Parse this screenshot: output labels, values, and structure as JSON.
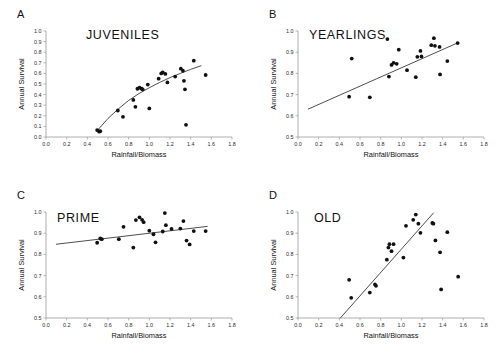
{
  "figure": {
    "background": "#ffffff",
    "point_color": "#101010",
    "line_color": "#3a3a3a",
    "axis_color": "#9a9a9a"
  },
  "axes": {
    "xlabel": "Rainfall/Biomass",
    "ylabel": "Annual Survival",
    "xlim": [
      0.0,
      1.8
    ],
    "xticks": [
      "0.0",
      "0.2",
      "0.4",
      "0.6",
      "0.8",
      "1.0",
      "1.2",
      "1.4",
      "1.6",
      "1.8"
    ],
    "yticks_full": [
      "0.0",
      "0.1",
      "0.2",
      "0.3",
      "0.4",
      "0.5",
      "0.6",
      "0.7",
      "0.8",
      "0.9",
      "1.0"
    ],
    "yticks_half": [
      "0.5",
      "0.6",
      "0.7",
      "0.8",
      "0.9",
      "1.0"
    ]
  },
  "panels": [
    {
      "letter": "A",
      "title": "JUVENILES"
    },
    {
      "letter": "B",
      "title": "YEARLINGS"
    },
    {
      "letter": "C",
      "title": "PRIME"
    },
    {
      "letter": "D",
      "title": "OLD"
    }
  ],
  "chart_data": [
    {
      "type": "scatter",
      "panel": "A",
      "title": "JUVENILES",
      "xlabel": "Rainfall/Biomass",
      "ylabel": "Annual Survival",
      "xlim": [
        0.0,
        1.8
      ],
      "ylim": [
        0.0,
        1.0
      ],
      "grid": false,
      "legend": "none",
      "fit": {
        "kind": "curve",
        "note": "saturating (log-like) fitted curve",
        "points": [
          [
            0.5,
            0.065
          ],
          [
            0.6,
            0.175
          ],
          [
            0.7,
            0.265
          ],
          [
            0.8,
            0.345
          ],
          [
            0.9,
            0.41
          ],
          [
            1.0,
            0.465
          ],
          [
            1.1,
            0.515
          ],
          [
            1.2,
            0.56
          ],
          [
            1.3,
            0.6
          ],
          [
            1.4,
            0.638
          ],
          [
            1.5,
            0.672
          ]
        ]
      },
      "x": [
        0.495,
        0.515,
        0.525,
        0.695,
        0.745,
        0.845,
        0.865,
        0.885,
        0.905,
        0.925,
        0.935,
        0.985,
        1.0,
        1.09,
        1.115,
        1.13,
        1.155,
        1.175,
        1.25,
        1.305,
        1.325,
        1.335,
        1.345,
        1.355,
        1.43,
        1.545
      ],
      "y": [
        0.065,
        0.05,
        0.055,
        0.25,
        0.19,
        0.35,
        0.285,
        0.455,
        0.465,
        0.455,
        0.45,
        0.495,
        0.27,
        0.55,
        0.6,
        0.61,
        0.595,
        0.515,
        0.57,
        0.645,
        0.625,
        0.53,
        0.45,
        0.115,
        0.72,
        0.585
      ]
    },
    {
      "type": "scatter",
      "panel": "B",
      "title": "YEARLINGS",
      "xlabel": "Rainfall/Biomass",
      "ylabel": "Annual Survival",
      "xlim": [
        0.0,
        1.8
      ],
      "ylim": [
        0.5,
        1.0
      ],
      "grid": false,
      "legend": "none",
      "fit": {
        "kind": "line",
        "note": "positive linear regression",
        "points": [
          [
            0.1,
            0.632
          ],
          [
            1.55,
            0.945
          ]
        ]
      },
      "x": [
        0.495,
        0.52,
        0.695,
        0.865,
        0.88,
        0.905,
        0.925,
        0.955,
        0.975,
        1.055,
        1.14,
        1.155,
        1.185,
        1.195,
        1.29,
        1.315,
        1.325,
        1.37,
        1.375,
        1.445,
        1.545
      ],
      "y": [
        0.69,
        0.87,
        0.687,
        0.962,
        0.785,
        0.84,
        0.85,
        0.845,
        0.912,
        0.815,
        0.782,
        0.878,
        0.906,
        0.88,
        0.933,
        0.966,
        0.93,
        0.925,
        0.795,
        0.858,
        0.943
      ]
    },
    {
      "type": "scatter",
      "panel": "C",
      "title": "PRIME",
      "xlabel": "Rainfall/Biomass",
      "ylabel": "Annual Survival",
      "xlim": [
        0.0,
        1.8
      ],
      "ylim": [
        0.5,
        1.0
      ],
      "grid": false,
      "legend": "none",
      "fit": {
        "kind": "line",
        "note": "shallow positive linear regression",
        "points": [
          [
            0.1,
            0.848
          ],
          [
            1.56,
            0.932
          ]
        ]
      },
      "x": [
        0.495,
        0.525,
        0.54,
        0.705,
        0.75,
        0.845,
        0.87,
        0.905,
        0.93,
        0.945,
        1.0,
        1.04,
        1.06,
        1.13,
        1.15,
        1.16,
        1.215,
        1.3,
        1.33,
        1.36,
        1.39,
        1.43,
        1.545
      ],
      "y": [
        0.855,
        0.875,
        0.872,
        0.872,
        0.93,
        0.832,
        0.962,
        0.975,
        0.963,
        0.952,
        0.912,
        0.895,
        0.857,
        0.908,
        0.995,
        0.938,
        0.92,
        0.922,
        0.957,
        0.865,
        0.847,
        0.91,
        0.91
      ]
    },
    {
      "type": "scatter",
      "panel": "D",
      "title": "OLD",
      "xlabel": "Rainfall/Biomass",
      "ylabel": "Annual Survival",
      "xlim": [
        0.0,
        1.8
      ],
      "ylim": [
        0.5,
        1.0
      ],
      "grid": false,
      "legend": "none",
      "fit": {
        "kind": "line",
        "note": "steep positive linear regression",
        "points": [
          [
            0.41,
            0.5
          ],
          [
            1.31,
            0.995
          ]
        ]
      },
      "x": [
        0.495,
        0.515,
        0.695,
        0.745,
        0.755,
        0.86,
        0.875,
        0.885,
        0.905,
        0.925,
        1.02,
        1.045,
        1.115,
        1.14,
        1.165,
        1.185,
        1.3,
        1.31,
        1.33,
        1.375,
        1.385,
        1.445,
        1.55
      ],
      "y": [
        0.68,
        0.595,
        0.62,
        0.658,
        0.652,
        0.775,
        0.832,
        0.848,
        0.815,
        0.848,
        0.785,
        0.935,
        0.963,
        0.988,
        0.945,
        0.902,
        0.948,
        0.945,
        0.866,
        0.81,
        0.635,
        0.905,
        0.695
      ]
    }
  ]
}
